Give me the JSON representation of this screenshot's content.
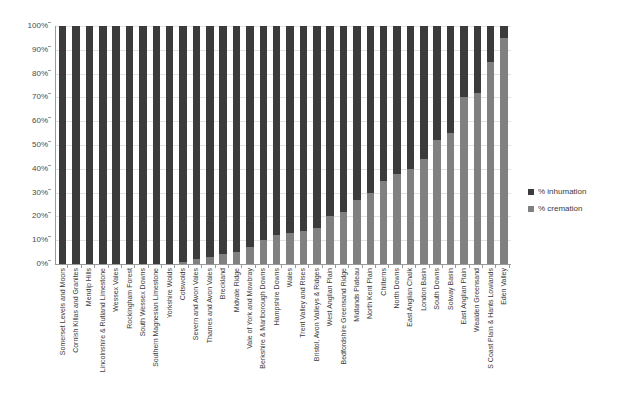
{
  "chart_data": {
    "type": "bar",
    "subtype": "stacked-percentage-column",
    "title": "",
    "xlabel": "",
    "ylabel": "",
    "ylim": [
      0,
      100
    ],
    "ytick_labels": [
      "100%",
      "90%",
      "80%",
      "70%",
      "60%",
      "50%",
      "40%",
      "30%",
      "20%",
      "10%",
      "0%"
    ],
    "ytick_values": [
      100,
      90,
      80,
      70,
      60,
      50,
      40,
      30,
      20,
      10,
      0
    ],
    "grid": true,
    "legend_position": "right",
    "categories": [
      "Somerset Levels and Moors",
      "Cornish Killas and Granites",
      "Mendip Hills",
      "Lincolnshire & Rutland Limestone",
      "Wessex Vales",
      "Rockingham Forest",
      "South Wessex Downs",
      "Southern Magnesian Limestone",
      "Yorkshire Wolds",
      "Cotswolds",
      "Severn and Avon Vales",
      "Thames and Avon Vales",
      "Breckland",
      "Midvale Ridge",
      "Vale of York and Mowbray",
      "Berkshire & Marlborough Downs",
      "Hampshire Downs",
      "Wales",
      "Trent Valley and Rises",
      "Bristol, Avon Valleys & Ridges",
      "West Anglian Plain",
      "Bedfordshire Greensand Ridge",
      "Midlands Plateau",
      "North Kent Plain",
      "Chilterns",
      "North Downs",
      "East Anglian Chalk",
      "London Basin",
      "South Downs",
      "Solway Basin",
      "East Anglian Plain",
      "Wealden Greensand",
      "S Coast Plain & Hants Lowlands",
      "Eden Valley"
    ],
    "series": [
      {
        "name": "% inhumation",
        "color": "#3b3b3b",
        "values": [
          100,
          100,
          100,
          100,
          100,
          100,
          100,
          100,
          100,
          99,
          98,
          97,
          96,
          95,
          93,
          90,
          88,
          87,
          86,
          85,
          80,
          78,
          73,
          70,
          65,
          62,
          60,
          56,
          48,
          45,
          30,
          28,
          15,
          5
        ]
      },
      {
        "name": "% cremation",
        "color": "#808080",
        "values": [
          0,
          0,
          0,
          0,
          0,
          0,
          0,
          0,
          0,
          1,
          2,
          3,
          4,
          5,
          7,
          10,
          12,
          13,
          14,
          15,
          20,
          22,
          27,
          30,
          35,
          38,
          40,
          44,
          52,
          55,
          70,
          72,
          85,
          95
        ]
      }
    ],
    "legend": [
      {
        "label": "% inhumation",
        "color": "#3b3b3b"
      },
      {
        "label": "% cremation",
        "color": "#808080"
      }
    ]
  }
}
